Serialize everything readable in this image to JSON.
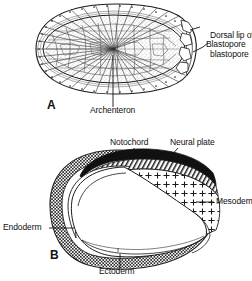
{
  "figure": {
    "background_color": "#ffffff",
    "ink_color": "#111111",
    "width": 252,
    "height": 281
  },
  "panel_a": {
    "letter": "A",
    "description": "Gastrula sagittal section showing archenteron, blastopore and dorsal lip",
    "labels": {
      "dorsal_lip_line1": "Dorsal lip of",
      "dorsal_lip_line2": "blastopore",
      "blastopore": "Blastopore",
      "archenteron": "Archenteron"
    }
  },
  "panel_b": {
    "letter": "B",
    "description": "Neurula sagittal section showing germ layers",
    "labels": {
      "notochord": "Notochord",
      "neural_plate": "Neural plate",
      "mesoderm": "Mesoderm",
      "endoderm": "Endoderm",
      "ectoderm": "Ectoderm"
    },
    "fills": {
      "neural_plate_color": "#111111",
      "notochord_pattern": "diagonal-hatch",
      "mesoderm_pattern": "plus-marks",
      "ectoderm_pattern": "checker-stipple",
      "endoderm_pattern": "checker-stipple",
      "archenteron_cavity_color": "#ffffff"
    }
  }
}
